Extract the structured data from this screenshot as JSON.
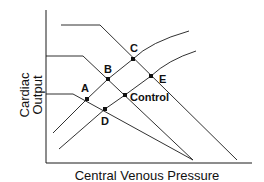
{
  "diagram": {
    "x_axis_label": "Central Venous Pressure",
    "y_axis_label_line1": "Cardiac",
    "y_axis_label_line2": "Output",
    "points": {
      "A": "A",
      "B": "B",
      "C": "C",
      "D": "D",
      "E": "E",
      "control": "Control"
    },
    "line_color": "#1a1a1a",
    "background_color": "#ffffff"
  }
}
